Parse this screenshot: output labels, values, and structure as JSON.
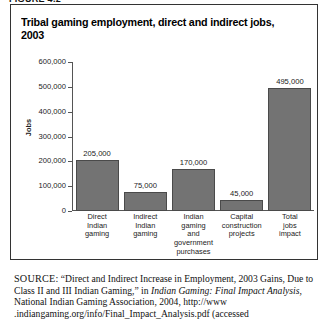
{
  "figure_label": "FIGURE 4.2",
  "chart_title": "Tribal gaming employment, direct and indirect jobs, 2003",
  "chart_data": {
    "type": "bar",
    "title": "Tribal gaming employment, direct and indirect jobs, 2003",
    "xlabel": "",
    "ylabel": "Jobs",
    "ylim": [
      0,
      600000
    ],
    "grid": false,
    "legend": "none",
    "categories": [
      "Direct Indian gaming",
      "Indirect Indian gaming",
      "Indian gaming and government purchases",
      "Capital construction projects",
      "Total jobs impact"
    ],
    "category_lines": [
      [
        "Direct",
        "Indian",
        "gaming"
      ],
      [
        "Indirect",
        "Indian",
        "gaming"
      ],
      [
        "Indian",
        "gaming",
        "and",
        "government",
        "purchases"
      ],
      [
        "Capital",
        "construction",
        "projects"
      ],
      [
        "Total",
        "jobs",
        "impact"
      ]
    ],
    "values": [
      205000,
      75000,
      170000,
      45000,
      495000
    ],
    "value_labels": [
      "205,000",
      "75,000",
      "170,000",
      "45,000",
      "495,000"
    ],
    "ytick_values": [
      600000,
      500000,
      400000,
      300000,
      200000,
      100000,
      0
    ],
    "ytick_labels": [
      "600,000",
      "500,000",
      "400,000",
      "300,000",
      "200,000",
      "100,000",
      "0"
    ],
    "bar_color": "#737373",
    "bar_edge_color": "#4a4a4a"
  },
  "source": {
    "prefix": "SOURCE:",
    "part1": " “Direct and Indirect Increase in Employment, 2003 Gains, Due to Class II and III Indian Gaming,” in ",
    "italic1": "Indian Gaming: Final Impact Analysis,",
    "part2": " National Indian Gaming Association, 2004, http://www .indiangaming.org/info/Final_Impact_Analysis.pdf (accessed"
  }
}
